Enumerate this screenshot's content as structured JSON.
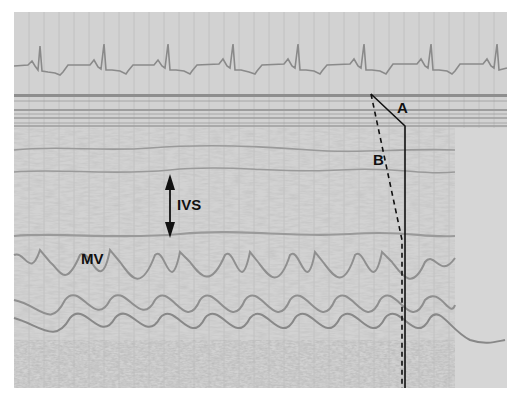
{
  "figure": {
    "type": "M-mode echocardiogram",
    "labels": {
      "a": "A",
      "b": "B",
      "ivs": "IVS",
      "mv": "MV"
    },
    "ecg": {
      "r_peaks_x": [
        41,
        104,
        168,
        233,
        298,
        364,
        431,
        497
      ]
    },
    "colors": {
      "paper": "#cfcfcf",
      "grid": "#b8b8b8",
      "trace": "#8a8a8a",
      "annotation": "#111111"
    }
  }
}
